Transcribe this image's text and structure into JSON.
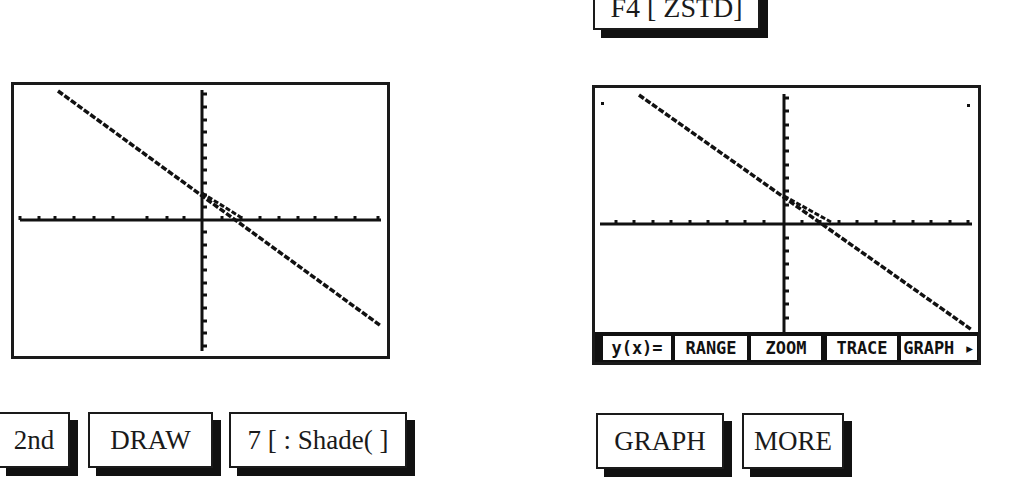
{
  "top_key": {
    "label": "F4 [ ZSTD]"
  },
  "left_screen": {
    "description": "graph screen after shading",
    "x_ticks": 20,
    "y_ticks": 20
  },
  "right_screen": {
    "menu": [
      {
        "label": "y(x)="
      },
      {
        "label": "RANGE"
      },
      {
        "label": "ZOOM"
      },
      {
        "label": "TRACE"
      },
      {
        "label": "GRAPH ▸"
      }
    ]
  },
  "left_keys": [
    {
      "label": "2nd"
    },
    {
      "label": "DRAW"
    },
    {
      "label": "7 [ : Shade( ]"
    }
  ],
  "right_keys": [
    {
      "label": "GRAPH"
    },
    {
      "label": "MORE"
    }
  ]
}
